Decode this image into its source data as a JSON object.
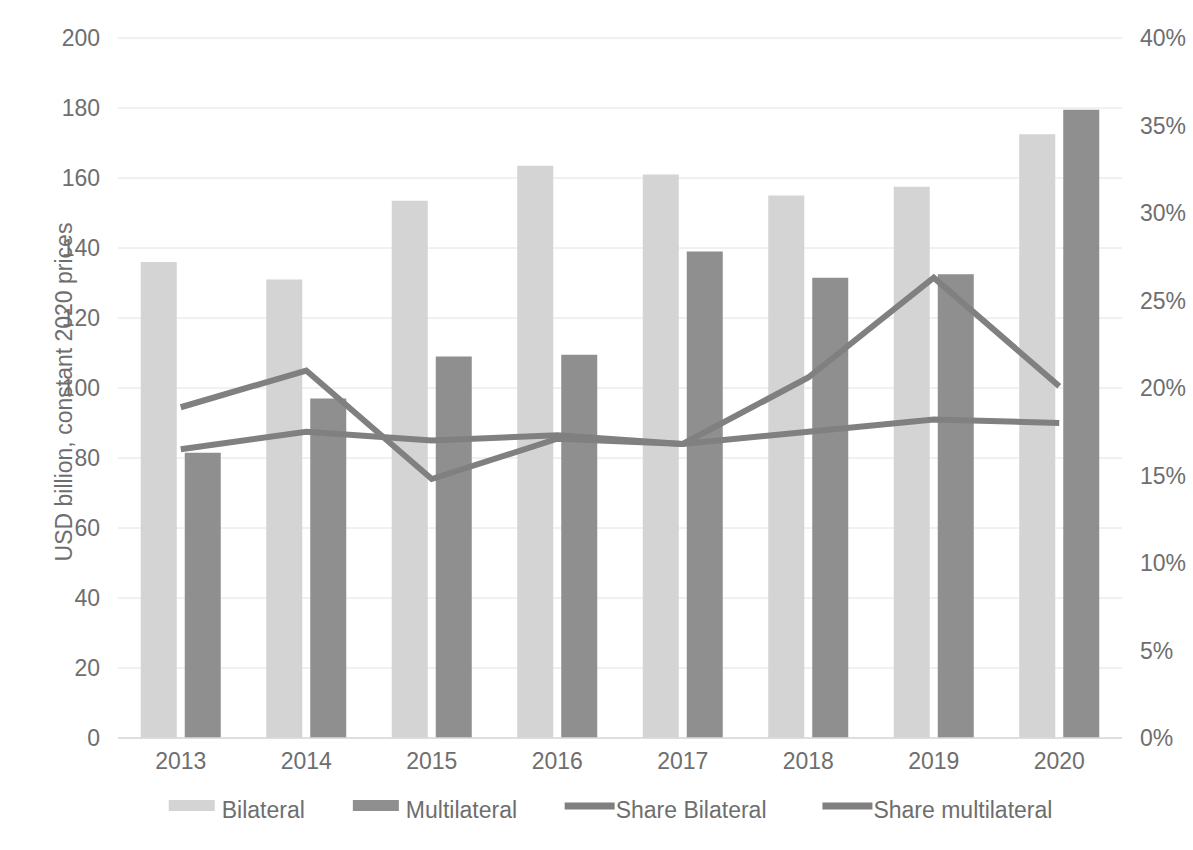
{
  "chart_data": {
    "type": "bar",
    "title": "",
    "subtitle": "",
    "categories": [
      "2013",
      "2014",
      "2015",
      "2016",
      "2017",
      "2018",
      "2019",
      "2020"
    ],
    "xlabel": "",
    "ylabel": "USD billion, constant 2020 prices",
    "ylabel_secondary": "",
    "ylim": [
      0,
      200
    ],
    "ytick_step": 20,
    "yticks": [
      "0",
      "20",
      "40",
      "60",
      "80",
      "100",
      "120",
      "140",
      "160",
      "180",
      "200"
    ],
    "ylim_secondary": [
      0,
      40
    ],
    "ytick_step_secondary": 5,
    "yticks_secondary": [
      "0%",
      "5%",
      "10%",
      "15%",
      "20%",
      "25%",
      "30%",
      "35%",
      "40%"
    ],
    "grid": true,
    "grid_axis": "y",
    "legend_position": "bottom",
    "series": [
      {
        "name": "Bilateral",
        "type": "bar",
        "axis": "left",
        "color": "#d4d4d4",
        "values": [
          136,
          131,
          153.5,
          163.5,
          161,
          155,
          157.5,
          172.5
        ]
      },
      {
        "name": "Multilateral",
        "type": "bar",
        "axis": "left",
        "color": "#8f8f8f",
        "values": [
          81.5,
          97,
          109,
          109.5,
          139,
          131.5,
          132.5,
          179.5
        ]
      },
      {
        "name": "Share Bilateral",
        "type": "line",
        "axis": "right",
        "color": "#808080",
        "values": [
          18.9,
          21,
          14.8,
          17.1,
          16.8,
          20.6,
          26.3,
          20.1
        ]
      },
      {
        "name": "Share multilateral",
        "type": "line",
        "axis": "right",
        "color": "#808080",
        "values": [
          16.5,
          17.5,
          17,
          17.3,
          16.8,
          17.5,
          18.2,
          18.0
        ]
      }
    ]
  },
  "legend": {
    "items": [
      {
        "label": "Bilateral",
        "marker": "swatch",
        "color": "#d4d4d4"
      },
      {
        "label": "Multilateral",
        "marker": "swatch",
        "color": "#8f8f8f"
      },
      {
        "label": "Share Bilateral",
        "marker": "line",
        "color": "#808080"
      },
      {
        "label": "Share multilateral",
        "marker": "line",
        "color": "#808080"
      }
    ]
  },
  "colors": {
    "bilateral": "#d4d4d4",
    "multilateral": "#8f8f8f",
    "line": "#808080",
    "grid": "#e2e2e2",
    "text": "#6e6e6e",
    "background": "#ffffff"
  }
}
